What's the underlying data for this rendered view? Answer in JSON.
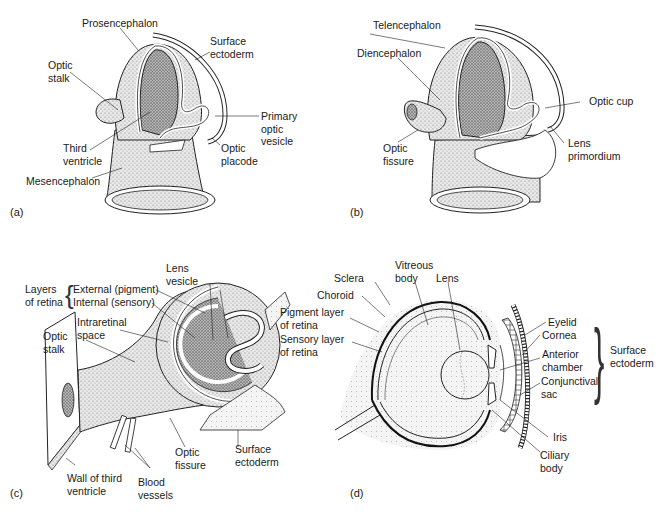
{
  "figure": {
    "panels": [
      {
        "id": "a",
        "letter": "(a)",
        "labels": {
          "prosencephalon": "Prosencephalon",
          "surface_ectoderm_1": "Surface",
          "surface_ectoderm_2": "ectoderm",
          "optic_stalk_1": "Optic",
          "optic_stalk_2": "stalk",
          "primary_optic_vesicle_1": "Primary",
          "primary_optic_vesicle_2": "optic",
          "primary_optic_vesicle_3": "vesicle",
          "third_ventricle_1": "Third",
          "third_ventricle_2": "ventricle",
          "optic_placode_1": "Optic",
          "optic_placode_2": "placode",
          "mesencephalon": "Mesencephalon"
        }
      },
      {
        "id": "b",
        "letter": "(b)",
        "labels": {
          "telencephalon": "Telencephalon",
          "diencephalon": "Diencephalon",
          "optic_cup": "Optic cup",
          "lens_primordium_1": "Lens",
          "lens_primordium_2": "primordium",
          "optic_fissure_1": "Optic",
          "optic_fissure_2": "fissure"
        }
      },
      {
        "id": "c",
        "letter": "(c)",
        "labels": {
          "layers_of_retina_1": "Layers",
          "layers_of_retina_2": "of retina",
          "external_pigment": "External (pigment)",
          "internal_sensory": "Internal (sensory)",
          "lens_vesicle_1": "Lens",
          "lens_vesicle_2": "vesicle",
          "intraretinal_space_1": "Intraretinal",
          "intraretinal_space_2": "space",
          "optic_stalk_1": "Optic",
          "optic_stalk_2": "stalk",
          "optic_fissure_1": "Optic",
          "optic_fissure_2": "fissure",
          "surface_ectoderm_1": "Surface",
          "surface_ectoderm_2": "ectoderm",
          "wall_third_ventricle_1": "Wall of third",
          "wall_third_ventricle_2": "ventricle",
          "blood_vessels_1": "Blood",
          "blood_vessels_2": "vessels"
        }
      },
      {
        "id": "d",
        "letter": "(d)",
        "labels": {
          "sclera": "Sclera",
          "vitreous_body_1": "Vitreous",
          "vitreous_body_2": "body",
          "lens": "Lens",
          "choroid": "Choroid",
          "pigment_layer_1": "Pigment layer",
          "pigment_layer_2": "of retina",
          "sensory_layer_1": "Sensory layer",
          "sensory_layer_2": "of retina",
          "eyelid": "Eyelid",
          "cornea": "Cornea",
          "anterior_chamber_1": "Anterior",
          "anterior_chamber_2": "chamber",
          "conjunctival_sac_1": "Conjunctival",
          "conjunctival_sac_2": "sac",
          "surface_ectoderm_1": "Surface",
          "surface_ectoderm_2": "ectoderm",
          "iris": "Iris",
          "ciliary_body_1": "Ciliary",
          "ciliary_body_2": "body"
        }
      }
    ]
  }
}
